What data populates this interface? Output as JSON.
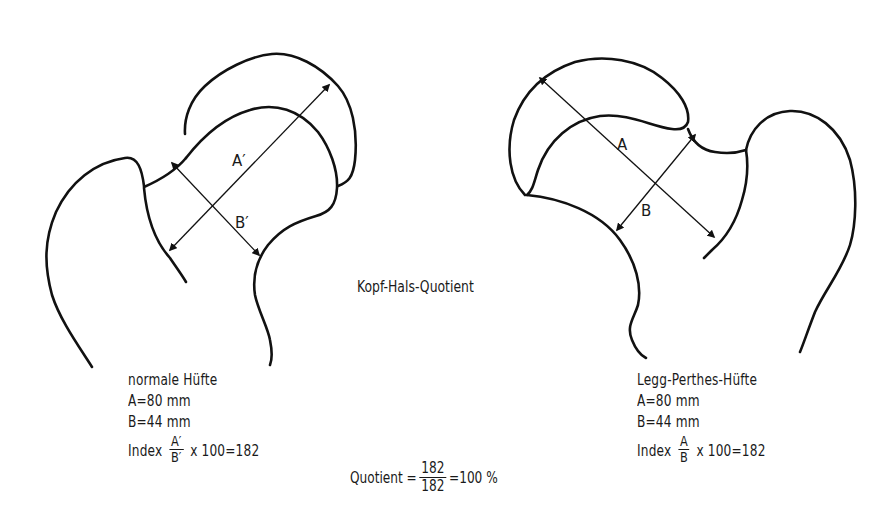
{
  "figure": {
    "center_title": "Kopf-Hals-Quotient",
    "left_hip": {
      "title": "normale Hüfte",
      "a_line": "A=80 mm",
      "b_line": "B=44 mm",
      "index_prefix": "Index",
      "index_numerator": "A′",
      "index_denominator": "B′",
      "index_suffix": "x 100=182",
      "diagram_labels": {
        "axis_a": "A′",
        "axis_b": "B′"
      }
    },
    "right_hip": {
      "title": "Legg-Perthes-Hüfte",
      "a_line": "A=80 mm",
      "b_line": "B=44 mm",
      "index_prefix": "Index",
      "index_numerator": "A",
      "index_denominator": "B",
      "index_suffix": "x 100=182",
      "diagram_labels": {
        "axis_a": "A",
        "axis_b": "B"
      }
    },
    "quotient": {
      "prefix": "Quotient =",
      "numerator": "182",
      "denominator": "182",
      "suffix": "=100 %"
    }
  },
  "colors": {
    "line": "#111111",
    "text": "#1a1a1a",
    "background": "#ffffff"
  }
}
